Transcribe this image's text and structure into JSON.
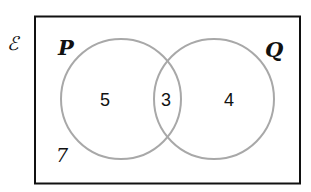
{
  "diagram": {
    "type": "venn",
    "universal_label": "ℰ",
    "sets": [
      {
        "name": "P",
        "only_count": "5"
      },
      {
        "name": "Q",
        "only_count": "4"
      }
    ],
    "intersection_count": "3",
    "outside_count": "7",
    "colors": {
      "border": "#111111",
      "circle": "#a8a8a8",
      "text": "#111111"
    }
  }
}
